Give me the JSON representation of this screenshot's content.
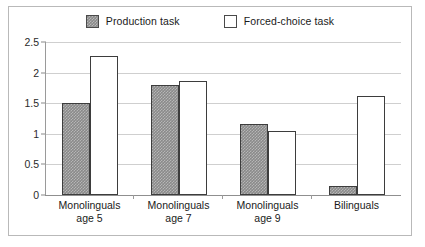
{
  "chart_data": {
    "type": "bar",
    "title": "",
    "xlabel": "",
    "ylabel": "",
    "ylim": [
      0,
      2.5
    ],
    "yticks": [
      "0",
      "0.5",
      "1",
      "1.5",
      "2",
      "2.5"
    ],
    "ytick_values": [
      0,
      0.5,
      1,
      1.5,
      2,
      2.5
    ],
    "grid": true,
    "legend_position": "top-center",
    "categories": [
      "Monolinguals\nage 5",
      "Monolinguals\nage 7",
      "Monolinguals\nage 9",
      "Bilinguals"
    ],
    "category_lines": [
      [
        "Monolinguals",
        "age 5"
      ],
      [
        "Monolinguals",
        "age 7"
      ],
      [
        "Monolinguals",
        "age 9"
      ],
      [
        "Bilinguals",
        ""
      ]
    ],
    "series": [
      {
        "name": "Production task",
        "color": "#8a8a8a",
        "fill": "hatched-gray",
        "values": [
          1.5,
          1.8,
          1.16,
          0.15
        ]
      },
      {
        "name": "Forced-choice task",
        "color": "#ffffff",
        "fill": "solid-white",
        "values": [
          2.27,
          1.87,
          1.04,
          1.62
        ]
      }
    ]
  },
  "legend": {
    "entries": [
      {
        "label": "Production task",
        "swatch": "gray"
      },
      {
        "label": "Forced-choice task",
        "swatch": "white"
      }
    ]
  },
  "colors": {
    "series_1": "#8a8a8a",
    "series_2": "#ffffff",
    "bar_border": "#3d3d3d",
    "gridline": "#cfcfcf",
    "axis": "#8f8f8f",
    "frame": "#b9b9b9",
    "text": "#1a1a1a"
  }
}
